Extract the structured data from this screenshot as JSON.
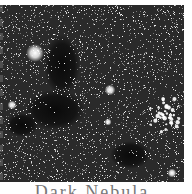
{
  "image": {
    "subject": "star field with dark nebula and star cluster",
    "colors": {
      "background": "#2a2a2a",
      "nebula": "#0e0e0e",
      "star": "#ffffff"
    },
    "bright_stars": [
      {
        "x": 35,
        "y": 48,
        "r": 5
      },
      {
        "x": 110,
        "y": 85,
        "r": 3
      },
      {
        "x": 12,
        "y": 100,
        "r": 2.5
      },
      {
        "x": 172,
        "y": 168,
        "r": 2.5
      },
      {
        "x": 108,
        "y": 117,
        "r": 2
      }
    ],
    "cluster": {
      "x": 163,
      "y": 110,
      "spread": 18,
      "count": 40
    },
    "dark_regions": [
      {
        "x": 62,
        "y": 60,
        "rx": 18,
        "ry": 30
      },
      {
        "x": 55,
        "y": 105,
        "rx": 30,
        "ry": 20
      },
      {
        "x": 22,
        "y": 120,
        "rx": 16,
        "ry": 12
      },
      {
        "x": 130,
        "y": 150,
        "rx": 20,
        "ry": 14
      }
    ]
  },
  "caption": "Dark Nebula"
}
